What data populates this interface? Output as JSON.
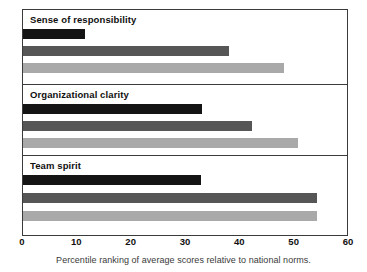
{
  "chart_data": {
    "type": "bar",
    "orientation": "horizontal",
    "title": "",
    "xlabel": "",
    "ylabel": "",
    "xlim": [
      0,
      60
    ],
    "xticks": [
      0,
      10,
      20,
      30,
      40,
      50,
      60
    ],
    "xtick_labels": [
      "0",
      "10",
      "20",
      "30",
      "40",
      "50",
      "60"
    ],
    "grid": false,
    "legend": false,
    "caption": "Percentile ranking of average scores relative to national norms.",
    "categories": [
      "Sense of responsibility",
      "Organizational clarity",
      "Team spirit"
    ],
    "series": [
      {
        "name": "bar-1",
        "color": "#141414",
        "values": [
          11.5,
          33.3,
          33.0
        ]
      },
      {
        "name": "bar-2",
        "color": "#565656",
        "values": [
          38.3,
          42.5,
          54.6
        ]
      },
      {
        "name": "bar-3",
        "color": "#a9a9a9",
        "values": [
          48.4,
          51.1,
          54.6
        ]
      }
    ],
    "panels": [
      {
        "label": "Sense of responsibility",
        "bars": [
          {
            "series": "bar-1",
            "value": 11.5,
            "color": "#141414"
          },
          {
            "series": "bar-2",
            "value": 38.3,
            "color": "#565656"
          },
          {
            "series": "bar-3",
            "value": 48.4,
            "color": "#a9a9a9"
          }
        ]
      },
      {
        "label": "Organizational clarity",
        "bars": [
          {
            "series": "bar-1",
            "value": 33.3,
            "color": "#141414"
          },
          {
            "series": "bar-2",
            "value": 42.5,
            "color": "#565656"
          },
          {
            "series": "bar-3",
            "value": 51.1,
            "color": "#a9a9a9"
          }
        ]
      },
      {
        "label": "Team spirit",
        "bars": [
          {
            "series": "bar-1",
            "value": 33.0,
            "color": "#141414"
          },
          {
            "series": "bar-2",
            "value": 54.6,
            "color": "#565656"
          },
          {
            "series": "bar-3",
            "value": 54.6,
            "color": "#a9a9a9"
          }
        ]
      }
    ]
  },
  "figure": {
    "frame_color": "#3b3b3b",
    "background": "#ffffff"
  }
}
